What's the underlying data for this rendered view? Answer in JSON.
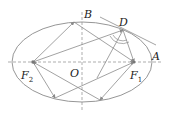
{
  "figure": {
    "type": "ellipse-reflection-diagram",
    "colors": {
      "stroke": "#8a8a8a",
      "axis": "#8a8a8a",
      "text": "#222222",
      "background": "#ffffff"
    },
    "labels": {
      "B": "B",
      "D": "D",
      "A": "A",
      "O": "O",
      "F1_main": "F",
      "F1_sub": "1",
      "F2_main": "F",
      "F2_sub": "2"
    }
  }
}
